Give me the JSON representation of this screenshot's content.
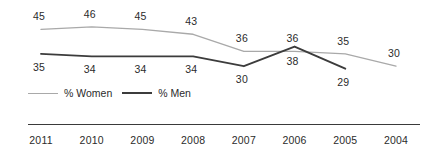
{
  "chart_data": {
    "type": "line",
    "title": "",
    "subtitle": "",
    "xlabel": "",
    "ylabel": "",
    "grid": false,
    "legend_position": "bottom-left",
    "categories": [
      "2011",
      "2010",
      "2009",
      "2008",
      "2007",
      "2006",
      "2005",
      "2004"
    ],
    "ylim": [
      26,
      48
    ],
    "series": [
      {
        "name": "% Women",
        "color": "#a9a9a9",
        "values": [
          45,
          46,
          45,
          43,
          36,
          36,
          35,
          30
        ],
        "label_position": "above"
      },
      {
        "name": "% Men",
        "color": "#3c3c3c",
        "values": [
          35,
          34,
          34,
          34,
          30,
          38,
          29,
          null
        ],
        "label_position": "below"
      }
    ]
  },
  "legend": {
    "items": [
      {
        "label": "% Women",
        "color": "#a9a9a9"
      },
      {
        "label": "% Men",
        "color": "#3c3c3c"
      }
    ]
  },
  "axis": {
    "years": [
      "2011",
      "2010",
      "2009",
      "2008",
      "2007",
      "2006",
      "2005",
      "2004"
    ]
  },
  "labels": {
    "women": [
      "45",
      "46",
      "45",
      "43",
      "36",
      "36",
      "35",
      "30"
    ],
    "men": [
      "35",
      "34",
      "34",
      "34",
      "30",
      "38",
      "29"
    ]
  },
  "colors": {
    "women_line": "#a9a9a9",
    "men_line": "#3c3c3c",
    "axis_rule": "#3a3a3a",
    "text": "#2b2b2b",
    "background": "#ffffff"
  }
}
